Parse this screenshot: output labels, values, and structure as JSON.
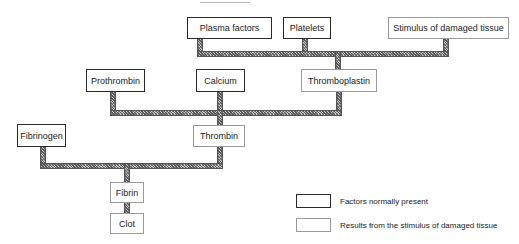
{
  "diagram": {
    "type": "flowchart",
    "nodes": {
      "plasma_factors": {
        "label": "Plasma factors",
        "kind": "normal"
      },
      "platelets": {
        "label": "Platelets",
        "kind": "normal"
      },
      "stimulus": {
        "label": "Stimulus of damaged tissue",
        "kind": "result"
      },
      "prothrombin": {
        "label": "Prothrombin",
        "kind": "normal"
      },
      "calcium": {
        "label": "Calcium",
        "kind": "normal"
      },
      "thromboplastin": {
        "label": "Thromboplastin",
        "kind": "result"
      },
      "fibrinogen": {
        "label": "Fibrinogen",
        "kind": "normal"
      },
      "thrombin": {
        "label": "Thrombin",
        "kind": "result"
      },
      "fibrin": {
        "label": "Fibrin",
        "kind": "result"
      },
      "clot": {
        "label": "Clot",
        "kind": "result"
      }
    },
    "edges": [
      {
        "from": [
          "plasma_factors",
          "platelets",
          "stimulus"
        ],
        "to": "thromboplastin"
      },
      {
        "from": [
          "prothrombin",
          "calcium",
          "thromboplastin"
        ],
        "to": "thrombin"
      },
      {
        "from": [
          "fibrinogen",
          "thrombin"
        ],
        "to": "fibrin"
      },
      {
        "from": [
          "fibrin"
        ],
        "to": "clot"
      }
    ]
  },
  "legend": {
    "normal": "Factors normally present",
    "result": "Results from the stimulus of damaged tissue"
  },
  "colors": {
    "normal_border": "#2a2a2a",
    "result_border": "#9a9a9a",
    "connector": "#8a8a8a"
  }
}
